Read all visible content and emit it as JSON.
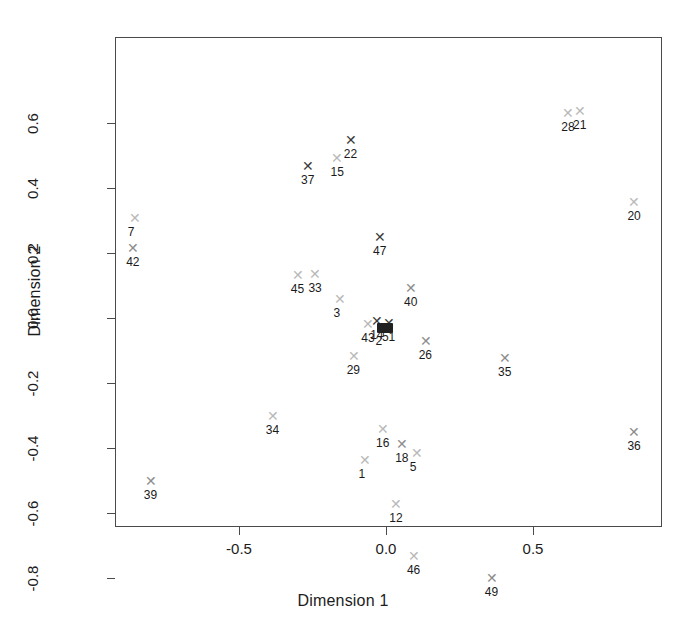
{
  "chart_data": {
    "type": "scatter",
    "title": "",
    "xlabel": "Dimension 1",
    "ylabel": "Dimension 2",
    "xlim": [
      -0.92,
      0.94
    ],
    "ylim": [
      -0.86,
      0.7
    ],
    "xticks": [
      -0.5,
      0.0,
      0.5
    ],
    "xticklabels": [
      "-0.5",
      "0.0",
      "0.5"
    ],
    "yticks": [
      0.6,
      0.4,
      0.2,
      0.0,
      -0.2,
      -0.4,
      -0.6,
      -0.8
    ],
    "yticklabels": [
      "0.6",
      "0.4",
      "0.2",
      "0.0",
      "-0.2",
      "-0.4",
      "-0.6",
      "-0.8"
    ],
    "grid": false,
    "legend": null,
    "marker": "x",
    "points": [
      {
        "label": "7",
        "x": -0.855,
        "y": 0.305,
        "tone": "faint",
        "place": "below"
      },
      {
        "label": "42",
        "x": -0.86,
        "y": 0.212,
        "tone": "mid",
        "place": "below"
      },
      {
        "label": "39",
        "x": -0.8,
        "y": -0.505,
        "tone": "mid",
        "place": "below"
      },
      {
        "label": "34",
        "x": -0.385,
        "y": -0.305,
        "tone": "faint",
        "place": "below"
      },
      {
        "label": "45",
        "x": -0.3,
        "y": 0.13,
        "tone": "faint",
        "place": "below"
      },
      {
        "label": "33",
        "x": -0.24,
        "y": 0.133,
        "tone": "faint",
        "place": "below"
      },
      {
        "label": "37",
        "x": -0.265,
        "y": 0.465,
        "tone": "dark",
        "place": "below"
      },
      {
        "label": "15",
        "x": -0.165,
        "y": 0.49,
        "tone": "faint",
        "place": "below"
      },
      {
        "label": "22",
        "x": -0.12,
        "y": 0.545,
        "tone": "dark",
        "place": "below"
      },
      {
        "label": "3",
        "x": -0.155,
        "y": 0.055,
        "tone": "faint",
        "place": "below"
      },
      {
        "label": "29",
        "x": -0.11,
        "y": -0.12,
        "tone": "faint",
        "place": "below"
      },
      {
        "label": "1",
        "x": -0.07,
        "y": -0.44,
        "tone": "faint",
        "place": "below"
      },
      {
        "label": "16",
        "x": -0.01,
        "y": -0.345,
        "tone": "faint",
        "place": "below"
      },
      {
        "label": "47",
        "x": -0.02,
        "y": 0.245,
        "tone": "dark",
        "place": "below"
      },
      {
        "label": "43",
        "x": -0.06,
        "y": -0.022,
        "tone": "faint",
        "place": "below"
      },
      {
        "label": "14",
        "x": -0.03,
        "y": -0.012,
        "tone": "dark",
        "place": "below"
      },
      {
        "label": "2",
        "x": -0.012,
        "y": -0.03,
        "tone": "dark",
        "place": "below"
      },
      {
        "label": "51",
        "x": 0.01,
        "y": -0.02,
        "tone": "dark",
        "place": "below"
      },
      {
        "label": "12",
        "x": 0.035,
        "y": -0.575,
        "tone": "faint",
        "place": "below"
      },
      {
        "label": "18",
        "x": 0.055,
        "y": -0.39,
        "tone": "mid",
        "place": "below"
      },
      {
        "label": "5",
        "x": 0.105,
        "y": -0.42,
        "tone": "faint",
        "place": "below"
      },
      {
        "label": "40",
        "x": 0.085,
        "y": 0.09,
        "tone": "mid",
        "place": "below"
      },
      {
        "label": "26",
        "x": 0.135,
        "y": -0.075,
        "tone": "mid",
        "place": "below"
      },
      {
        "label": "46",
        "x": 0.095,
        "y": -0.735,
        "tone": "faint",
        "place": "below"
      },
      {
        "label": "49",
        "x": 0.36,
        "y": -0.805,
        "tone": "mid",
        "place": "below"
      },
      {
        "label": "35",
        "x": 0.405,
        "y": -0.125,
        "tone": "mid",
        "place": "below"
      },
      {
        "label": "28",
        "x": 0.62,
        "y": 0.63,
        "tone": "faint",
        "place": "below"
      },
      {
        "label": "21",
        "x": 0.66,
        "y": 0.635,
        "tone": "faint",
        "place": "below"
      },
      {
        "label": "20",
        "x": 0.845,
        "y": 0.355,
        "tone": "faint",
        "place": "below"
      },
      {
        "label": "36",
        "x": 0.845,
        "y": -0.355,
        "tone": "mid",
        "place": "below"
      }
    ]
  },
  "axes": {
    "xlabel": "Dimension 1",
    "ylabel": "Dimension 2"
  }
}
